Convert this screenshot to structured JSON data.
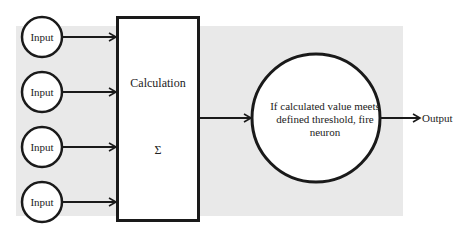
{
  "diagram": {
    "inputs": [
      {
        "label": "Input"
      },
      {
        "label": "Input"
      },
      {
        "label": "Input"
      },
      {
        "label": "Input"
      }
    ],
    "calculation": {
      "label": "Calculation",
      "symbol": "Σ"
    },
    "neuron": {
      "text": "If calculated value meets defined threshold, fire neuron"
    },
    "output": {
      "label": "Output"
    },
    "colors": {
      "background_shade": "#e9e9e9",
      "stroke": "#1a1a1a",
      "fill": "#ffffff"
    }
  }
}
